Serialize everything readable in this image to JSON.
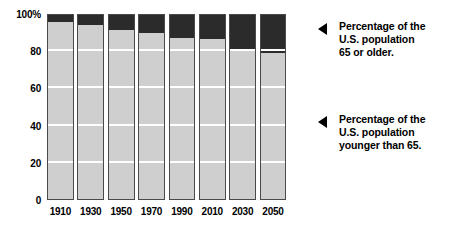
{
  "chart_data": {
    "type": "bar",
    "stacked": true,
    "title": "",
    "xlabel": "",
    "ylabel": "",
    "ylim": [
      0,
      100
    ],
    "yticks": [
      0,
      20,
      40,
      60,
      80,
      100
    ],
    "ytick_labels": [
      "0",
      "20",
      "40",
      "60",
      "80",
      "100%"
    ],
    "grid": true,
    "grid_color": "#ffffff",
    "legend_position": "right-annotations",
    "categories": [
      "1910",
      "1930",
      "1950",
      "1970",
      "1990",
      "2010",
      "2030",
      "2050"
    ],
    "series": [
      {
        "name": "Percentage of the U.S. population younger than 65.",
        "color": "#cfcfcf",
        "values": [
          96,
          94.5,
          92,
          90.5,
          87.5,
          87,
          81.5,
          79.5
        ]
      },
      {
        "name": "Percentage of the U.S. population 65 or older.",
        "color": "#2b2b2b",
        "values": [
          4,
          5.5,
          8,
          9.5,
          12.5,
          13,
          18.5,
          20.5
        ]
      }
    ]
  },
  "annotations": [
    {
      "id": "older",
      "icon": "left-arrow-icon",
      "text": "Percentage of the\nU.S. population\n65 or older."
    },
    {
      "id": "younger",
      "icon": "left-arrow-icon",
      "text": "Percentage of the\nU.S. population\nyounger than 65."
    }
  ],
  "colors": {
    "older": "#2b2b2b",
    "younger": "#cfcfcf",
    "bar_border": "#4a4a4a",
    "gridline": "#ffffff",
    "background": "#ffffff",
    "text": "#000000"
  }
}
